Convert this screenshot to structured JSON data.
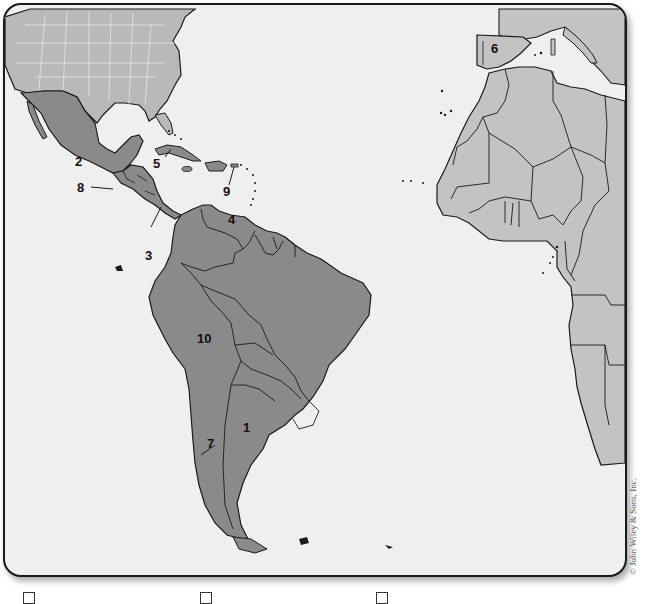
{
  "map": {
    "title": "",
    "colors": {
      "ocean": "#efefef",
      "latin_america": "#8a8a8a",
      "united_states": "#b9b9b9",
      "africa_europe": "#c3c3c3",
      "border": "#1a1a1a",
      "us_state_lines": "#e6e6e6"
    },
    "labels": [
      {
        "id": "1",
        "text": "1",
        "region": "Argentina"
      },
      {
        "id": "2",
        "text": "2",
        "region": "Mexico"
      },
      {
        "id": "3",
        "text": "3",
        "region": "Panama"
      },
      {
        "id": "4",
        "text": "4",
        "region": "Venezuela"
      },
      {
        "id": "5",
        "text": "5",
        "region": "Cuba"
      },
      {
        "id": "6",
        "text": "6",
        "region": "Spain"
      },
      {
        "id": "7",
        "text": "7",
        "region": "Chile"
      },
      {
        "id": "8",
        "text": "8",
        "region": "Guatemala"
      },
      {
        "id": "9",
        "text": "9",
        "region": "Puerto Rico"
      },
      {
        "id": "10",
        "text": "10",
        "region": "Peru"
      }
    ],
    "copyright": "© John Wiley & Sons, Inc."
  },
  "legend": {
    "items": [
      {
        "checkbox": "empty",
        "text": ""
      },
      {
        "checkbox": "empty",
        "text": ""
      },
      {
        "checkbox": "empty",
        "text": ""
      }
    ]
  }
}
